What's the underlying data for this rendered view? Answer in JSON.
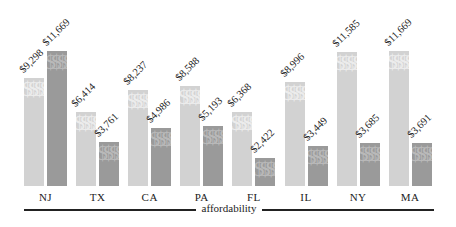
{
  "chart_data": {
    "type": "bar",
    "title": "",
    "xlabel": "affordability",
    "ylabel": "",
    "categories": [
      "NJ",
      "TX",
      "CA",
      "PA",
      "FL",
      "IL",
      "NY",
      "MA"
    ],
    "series": [
      {
        "name": "light",
        "color": "#d2d2d2",
        "values": [
          9298,
          6414,
          8237,
          8588,
          6368,
          8996,
          11585,
          11669
        ]
      },
      {
        "name": "dark",
        "color": "#9a9a9a",
        "values": [
          11669,
          3761,
          4986,
          5193,
          2422,
          3449,
          3685,
          3691
        ]
      }
    ],
    "labels": {
      "light": [
        "$9,298",
        "$6,414",
        "$8,237",
        "$8,588",
        "$6,368",
        "$8,996",
        "$11,585",
        "$11,669"
      ],
      "dark": [
        "$11,669",
        "$3,761",
        "$4,986",
        "$5,193",
        "$2,422",
        "$3,449",
        "$3,685",
        "$3,691"
      ]
    },
    "bar_pattern_glyph": "$",
    "grid": false,
    "legend": "none",
    "ylim": [
      0,
      12000
    ]
  }
}
